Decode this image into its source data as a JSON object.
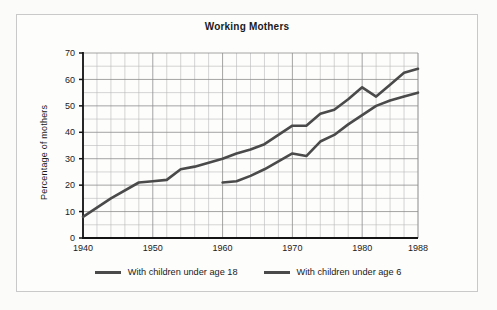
{
  "figure": {
    "title": "Working Mothers",
    "y_axis_label": "Percentage of mothers",
    "legend": [
      {
        "label": "With children under age 18",
        "color": "#4a4a4a"
      },
      {
        "label": "With children under age 6",
        "color": "#4a4a4a"
      }
    ]
  },
  "chart_data": {
    "type": "line",
    "title": "Working Mothers",
    "xlabel": "",
    "ylabel": "Percentage of mothers",
    "xlim": [
      1940,
      1988
    ],
    "ylim": [
      0,
      70
    ],
    "ytick_labels": [
      "0",
      "10",
      "20",
      "30",
      "40",
      "50",
      "60",
      "70"
    ],
    "yticks": [
      0,
      10,
      20,
      30,
      40,
      50,
      60,
      70
    ],
    "xtick_labels": [
      "1940",
      "1950",
      "1960",
      "1970",
      "1980",
      "1988"
    ],
    "xticks": [
      1940,
      1950,
      1960,
      1970,
      1980,
      1988
    ],
    "grid": true,
    "minor_grid_y_step": 5,
    "minor_grid_x_step": 2,
    "legend_position": "bottom",
    "series": [
      {
        "name": "With children under age 18",
        "color": "#4a4a4a",
        "x": [
          1940,
          1944,
          1948,
          1950,
          1952,
          1954,
          1956,
          1958,
          1960,
          1962,
          1964,
          1966,
          1968,
          1970,
          1972,
          1974,
          1976,
          1978,
          1980,
          1982,
          1984,
          1986,
          1988
        ],
        "values": [
          8,
          15,
          21,
          21.5,
          22,
          26,
          27,
          28.5,
          30,
          32,
          33.5,
          35.5,
          39,
          42.5,
          42.5,
          47,
          48.5,
          52.5,
          57,
          53.5,
          58,
          62.5,
          64
        ]
      },
      {
        "name": "With children under age 6",
        "color": "#4a4a4a",
        "x": [
          1960,
          1962,
          1964,
          1966,
          1968,
          1970,
          1972,
          1974,
          1976,
          1978,
          1980,
          1982,
          1984,
          1986,
          1988
        ],
        "values": [
          21,
          21.5,
          23.5,
          26,
          29,
          32,
          31,
          36.5,
          39,
          43,
          46.5,
          50,
          52,
          53.5,
          55
        ]
      }
    ]
  }
}
